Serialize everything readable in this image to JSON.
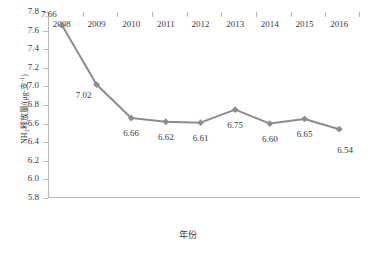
{
  "chart_data": {
    "type": "line",
    "title": "",
    "xlabel": "年份",
    "ylabel": "NH₃释放量/(μg·支⁻¹)",
    "ylabel_parts": {
      "lead": "NH",
      "sub": "3",
      "mid": "释放量/(μg·支",
      "sup": "-1",
      "tail": ")"
    },
    "categories": [
      "2008",
      "2009",
      "2010",
      "2011",
      "2012",
      "2013",
      "2014",
      "2015",
      "2016"
    ],
    "x": [
      2008,
      2009,
      2010,
      2011,
      2012,
      2013,
      2014,
      2015,
      2016
    ],
    "values": [
      7.66,
      7.02,
      6.66,
      6.62,
      6.61,
      6.75,
      6.6,
      6.65,
      6.54
    ],
    "point_labels": [
      "7.66",
      "7.02",
      "6.66",
      "6.62",
      "6.61",
      "6.75",
      "6.60",
      "6.65",
      "6.54"
    ],
    "label_positions": [
      "above-left",
      "below-left",
      "below",
      "below",
      "below",
      "below",
      "below",
      "below",
      "below-right"
    ],
    "ylim": [
      5.8,
      7.8
    ],
    "ytick_values": [
      5.8,
      6.0,
      6.2,
      6.4,
      6.6,
      6.8,
      7.0,
      7.2,
      7.4,
      7.6,
      7.8
    ],
    "ytick_labels": [
      "5.8",
      "6.0",
      "6.2",
      "6.4",
      "6.6",
      "6.8",
      "7.0",
      "7.2",
      "7.4",
      "7.6",
      "7.8"
    ],
    "xlim": [
      2007.6,
      2016.6
    ],
    "grid": false,
    "legend": false,
    "series_color": "#8c8c8c",
    "marker": "diamond",
    "marker_color": "#8c8c8c",
    "axis_color": "#b9b9b9",
    "text_color": "#3a3a3a",
    "background": "#ffffff"
  }
}
